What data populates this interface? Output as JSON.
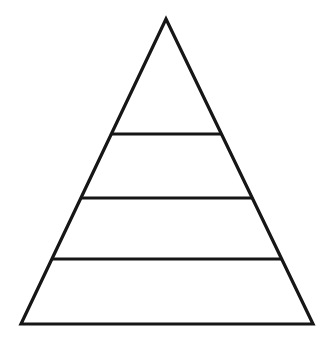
{
  "diagram": {
    "type": "pyramid",
    "levels": 4,
    "background_color": "#ffffff",
    "stroke_color": "#161616",
    "stroke_width": 3.2,
    "canvas": {
      "width": 336,
      "height": 350
    },
    "apex": {
      "x": 166,
      "y": 19
    },
    "base_left": {
      "x": 21,
      "y": 324
    },
    "base_right": {
      "x": 313,
      "y": 324
    },
    "divider_y": [
      134,
      198,
      259
    ]
  }
}
